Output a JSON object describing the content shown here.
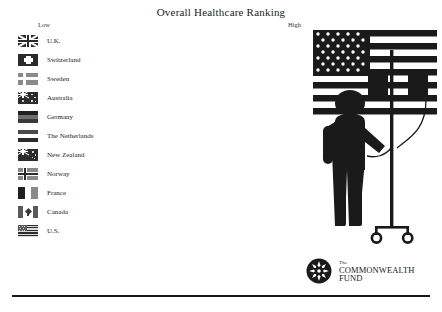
{
  "slide": {
    "title": "Overall Healthcare Ranking",
    "background_color": "#ffffff",
    "ink_color": "#1a1a1a"
  },
  "scale": {
    "low_label": "Low",
    "high_label": "High"
  },
  "ranking": {
    "order": "low to high",
    "items": [
      {
        "rank": 1,
        "country": "U.K.",
        "flag": "flag-uk"
      },
      {
        "rank": 2,
        "country": "Switzerland",
        "flag": "flag-switzerland"
      },
      {
        "rank": 3,
        "country": "Sweden",
        "flag": "flag-sweden"
      },
      {
        "rank": 4,
        "country": "Australia",
        "flag": "flag-australia"
      },
      {
        "rank": 5,
        "country": "Germany",
        "flag": "flag-germany"
      },
      {
        "rank": 6,
        "country": "The Netherlands",
        "flag": "flag-netherlands"
      },
      {
        "rank": 7,
        "country": "New Zealand",
        "flag": "flag-new-zealand"
      },
      {
        "rank": 8,
        "country": "Norway",
        "flag": "flag-norway"
      },
      {
        "rank": 9,
        "country": "France",
        "flag": "flag-france"
      },
      {
        "rank": 10,
        "country": "Canada",
        "flag": "flag-canada"
      },
      {
        "rank": 11,
        "country": "U.S.",
        "flag": "flag-us"
      }
    ]
  },
  "illustration": {
    "name": "patient-with-iv-pole-and-us-flag",
    "elements": [
      "us-flag-backdrop",
      "standing-person",
      "iv-pole",
      "iv-bag-left",
      "iv-bag-right",
      "iv-tube",
      "pole-wheels"
    ]
  },
  "logo": {
    "mark": "starburst-emblem",
    "line_the": "The",
    "line_main": "COMMONWEALTH",
    "line_main_2": "FUND"
  }
}
